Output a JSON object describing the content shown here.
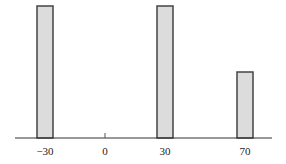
{
  "chart_data": {
    "type": "bar",
    "title": "",
    "xlabel": "",
    "ylabel": "",
    "categories": [
      "−30",
      "0",
      "30",
      "70"
    ],
    "x": [
      -30,
      0,
      30,
      70
    ],
    "values": [
      1.0,
      0.0,
      1.0,
      0.5
    ],
    "ylim": [
      0,
      1
    ],
    "grid": false,
    "legend": null,
    "colors": {
      "bar_fill": "#dcdcdc",
      "bar_stroke": "#444444",
      "axis": "#333333"
    }
  }
}
